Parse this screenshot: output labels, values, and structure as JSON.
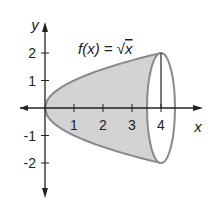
{
  "figure": {
    "function_label": "f(x) = √x",
    "function_label_parts": {
      "lhs": "f(x) = ",
      "radical": "√",
      "arg": "x"
    },
    "x_axis_label": "x",
    "y_axis_label": "y",
    "x_ticks": [
      "1",
      "2",
      "3",
      "4"
    ],
    "y_ticks": [
      "2",
      "1",
      "-1",
      "-2"
    ],
    "colors": {
      "fill": "#d3d3d3",
      "curve": "#8a8a8a",
      "axis": "#222222"
    }
  },
  "chart_data": {
    "type": "area",
    "title": "f(x) = √x",
    "function": "sqrt(x)",
    "x_range": [
      0,
      4
    ],
    "xlabel": "x",
    "ylabel": "y",
    "x_ticks": [
      1,
      2,
      3,
      4
    ],
    "y_ticks": [
      -2,
      -1,
      1,
      2
    ],
    "xlim": [
      -1.2,
      5.5
    ],
    "ylim": [
      -2.8,
      2.8
    ],
    "points": [
      [
        0,
        0
      ],
      [
        1,
        1
      ],
      [
        2,
        1.414
      ],
      [
        3,
        1.732
      ],
      [
        4,
        2
      ]
    ],
    "grid": false
  }
}
